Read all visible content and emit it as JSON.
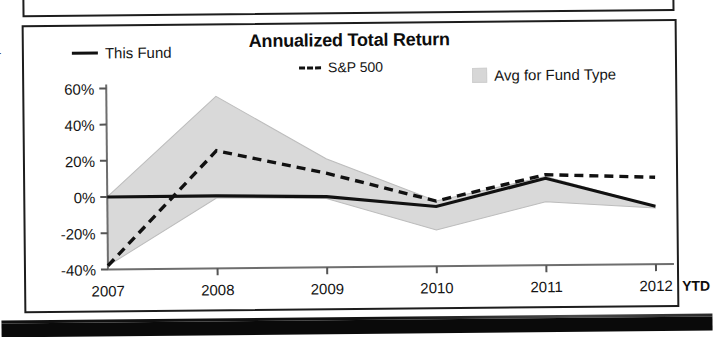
{
  "document": {
    "margin_mark": "r",
    "top_panel_label": ""
  },
  "chart_panel": {
    "title": "Annualized Total Return"
  },
  "legend": {
    "items": [
      {
        "label": "This Fund",
        "marker": "solid-line-swatch",
        "color": "#111111"
      },
      {
        "label": "S&P 500",
        "marker": "dashed-line-swatch",
        "color": "#111111"
      },
      {
        "label": "Avg for Fund Type",
        "marker": "shaded-box-swatch",
        "color": "#d7d7d7"
      }
    ]
  },
  "axes": {
    "y_ticks": [
      "60%",
      "40%",
      "20%",
      "0%",
      "-20%",
      "-40%"
    ],
    "x_ticks": [
      "2007",
      "2008",
      "2009",
      "2010",
      "2011",
      "2012"
    ],
    "ytd_suffix": "YTD"
  },
  "chart_data": {
    "type": "line",
    "title": "Annualized Total Return",
    "xlabel": "",
    "ylabel": "",
    "x": [
      "2007",
      "2008",
      "2009",
      "2010",
      "2011",
      "2012"
    ],
    "ylim": [
      -40,
      60
    ],
    "y_ticks": [
      -40,
      -20,
      0,
      20,
      40,
      60
    ],
    "y_tick_labels": [
      "-40%",
      "-20%",
      "0%",
      "20%",
      "40%",
      "60%"
    ],
    "grid": false,
    "legend_position": "top",
    "series": [
      {
        "name": "This Fund",
        "style": "solid",
        "color": "#111111",
        "values": [
          0,
          0,
          -1,
          -7,
          8,
          -8
        ]
      },
      {
        "name": "S&P 500",
        "style": "dashed",
        "color": "#111111",
        "values": [
          -38,
          25,
          12,
          -4,
          10,
          8
        ]
      },
      {
        "name": "Avg for Fund Type",
        "style": "shaded-band",
        "color": "#d7d7d7",
        "upper": [
          0,
          55,
          20,
          -4,
          9,
          -8
        ],
        "lower": [
          -38,
          -1,
          -2,
          -20,
          -5,
          -9
        ]
      }
    ],
    "annotations": [
      "YTD"
    ]
  }
}
